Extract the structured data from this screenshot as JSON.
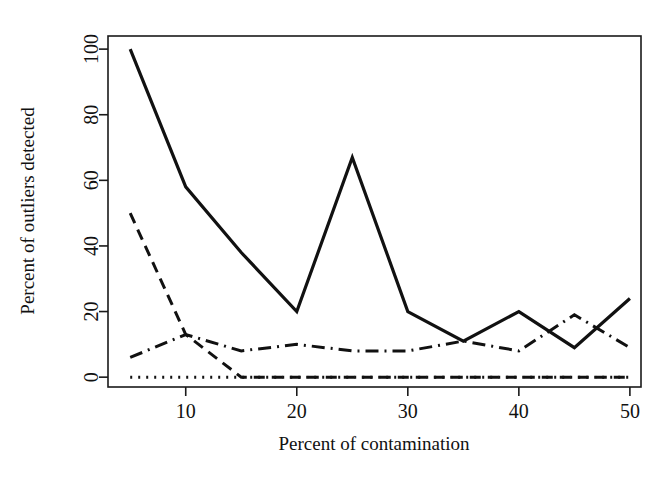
{
  "chart_data": {
    "type": "line",
    "title": "",
    "xlabel": "Percent of contamination",
    "ylabel": "Percent of outliers detected",
    "xlim": [
      3,
      51
    ],
    "ylim": [
      -3,
      104
    ],
    "xticks": [
      10,
      20,
      30,
      40,
      50
    ],
    "yticks": [
      0,
      20,
      40,
      60,
      80,
      100
    ],
    "xtick_labels": [
      "10",
      "20",
      "30",
      "40",
      "50"
    ],
    "ytick_labels": [
      "0",
      "20",
      "40",
      "60",
      "80",
      "100"
    ],
    "grid": false,
    "legend": "none",
    "box_frame": true,
    "x": [
      5,
      10,
      15,
      20,
      25,
      30,
      35,
      40,
      45,
      50
    ],
    "series": [
      {
        "name": "solid",
        "style": "solid",
        "dash": "none",
        "width": 3.2,
        "color": "#111111",
        "values": [
          100,
          58,
          38,
          20,
          67,
          20,
          11,
          20,
          9,
          24
        ]
      },
      {
        "name": "dashed",
        "style": "dashed",
        "dash": "11,7",
        "width": 3.0,
        "color": "#111111",
        "values": [
          50,
          13,
          0,
          0,
          0,
          0,
          0,
          0,
          0,
          0
        ]
      },
      {
        "name": "dash-dot",
        "style": "dash-dot",
        "dash": "13,6,2,6",
        "width": 3.0,
        "color": "#111111",
        "values": [
          6,
          13,
          8,
          10,
          8,
          8,
          11,
          8,
          19,
          9
        ]
      },
      {
        "name": "dotted",
        "style": "dotted",
        "dash": "2,6",
        "width": 3.0,
        "color": "#111111",
        "values": [
          0,
          0,
          0,
          0,
          0,
          0,
          0,
          0,
          0,
          0
        ]
      }
    ]
  },
  "plot_geometry": {
    "left": 108,
    "right": 641,
    "top": 36,
    "bottom": 387
  }
}
